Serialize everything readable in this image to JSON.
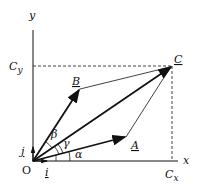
{
  "diagram": {
    "axes": {
      "x_label": "x",
      "y_label": "y",
      "origin_label": "O"
    },
    "unit_vectors": {
      "i": "i",
      "j": "j"
    },
    "vectors": [
      {
        "name": "A",
        "label": "A"
      },
      {
        "name": "B",
        "label": "B"
      },
      {
        "name": "C",
        "label": "C"
      }
    ],
    "components": {
      "cx": "C",
      "cx_sub": "x",
      "cy": "C",
      "cy_sub": "y"
    },
    "angles": {
      "alpha": "α",
      "beta": "β",
      "gamma": "γ"
    },
    "colors": {
      "stroke": "#111111",
      "background": "#ffffff"
    }
  }
}
